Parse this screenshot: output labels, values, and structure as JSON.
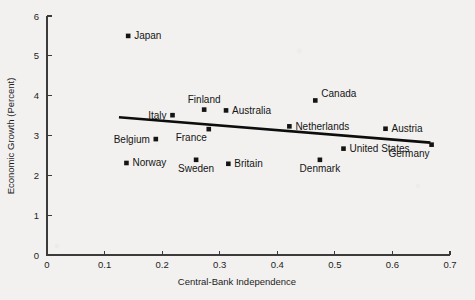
{
  "figure": {
    "background_color": "#f2f1ef",
    "ink_color": "#141414"
  },
  "chart_data": {
    "type": "scatter",
    "title": "",
    "subtitle": "",
    "xlabel": "Central-Bank Independence",
    "ylabel": "Economic Growth (Percent)",
    "xlim": [
      0,
      0.7
    ],
    "ylim": [
      0,
      6
    ],
    "xticks": [
      0,
      0.1,
      0.2,
      0.3,
      0.4,
      0.5,
      0.6,
      0.7
    ],
    "xticklabels": [
      "0",
      "0.1",
      "0.2",
      "0.3",
      "0.4",
      "0.5",
      "0.6",
      "0.7"
    ],
    "yticks": [
      0,
      1,
      2,
      3,
      4,
      5,
      6
    ],
    "yticklabels": [
      "0",
      "1",
      "2",
      "3",
      "4",
      "5",
      "6"
    ],
    "grid": false,
    "legend": "none",
    "marker_shape": "square",
    "marker_color": "#141414",
    "points": [
      {
        "label": "Japan",
        "x": 0.141,
        "y": 5.5,
        "label_side": "right"
      },
      {
        "label": "Canada",
        "x": 0.466,
        "y": 3.88,
        "label_side": "above-right"
      },
      {
        "label": "Finland",
        "x": 0.273,
        "y": 3.65,
        "label_side": "above"
      },
      {
        "label": "Australia",
        "x": 0.311,
        "y": 3.63,
        "label_side": "right"
      },
      {
        "label": "Italy",
        "x": 0.218,
        "y": 3.51,
        "label_side": "left"
      },
      {
        "label": "Netherlands",
        "x": 0.421,
        "y": 3.23,
        "label_side": "right"
      },
      {
        "label": "Austria",
        "x": 0.588,
        "y": 3.17,
        "label_side": "right"
      },
      {
        "label": "France",
        "x": 0.281,
        "y": 3.16,
        "label_side": "below-left"
      },
      {
        "label": "Belgium",
        "x": 0.189,
        "y": 2.91,
        "label_side": "left"
      },
      {
        "label": "Germany",
        "x": 0.668,
        "y": 2.77,
        "label_side": "below-left"
      },
      {
        "label": "United States",
        "x": 0.515,
        "y": 2.67,
        "label_side": "right"
      },
      {
        "label": "Denmark",
        "x": 0.474,
        "y": 2.39,
        "label_side": "below"
      },
      {
        "label": "Sweden",
        "x": 0.259,
        "y": 2.39,
        "label_side": "below"
      },
      {
        "label": "Norway",
        "x": 0.138,
        "y": 2.31,
        "label_side": "right"
      },
      {
        "label": "Britain",
        "x": 0.315,
        "y": 2.29,
        "label_side": "right"
      }
    ],
    "trend_line": {
      "x_start": 0.125,
      "y_start": 3.46,
      "x_end": 0.666,
      "y_end": 2.82,
      "color": "#0d0d0d",
      "width": 2.6
    }
  }
}
